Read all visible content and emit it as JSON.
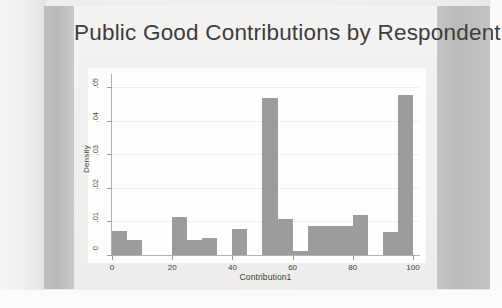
{
  "slide": {
    "title": "Public Good Contributions by Respondent",
    "background_color": "#f1f0ee",
    "band_color": "#bcbcbc"
  },
  "chart_data": {
    "type": "bar",
    "title": "Public Good Contributions by Respondent",
    "xlabel": "Contribution1",
    "ylabel": "Density",
    "xlim": [
      0,
      102
    ],
    "ylim": [
      0,
      0.054
    ],
    "xticks": [
      0,
      20,
      40,
      60,
      80,
      100
    ],
    "xtick_labels": [
      "0",
      "20",
      "40",
      "60",
      "80",
      "100"
    ],
    "yticks": [
      0,
      0.01,
      0.02,
      0.03,
      0.04,
      0.05
    ],
    "ytick_labels": [
      "0",
      ".01",
      ".02",
      ".03",
      ".04",
      ".05"
    ],
    "grid": true,
    "grid_axis": "y",
    "legend": "none",
    "bar_color": "#9c9c9c",
    "plot_background": "#fefefe",
    "bin_width": 5,
    "bins_start": [
      0,
      5,
      20,
      25,
      30,
      40,
      50,
      55,
      60,
      65,
      70,
      75,
      80,
      90,
      95
    ],
    "values": [
      0.0072,
      0.0044,
      0.0113,
      0.0044,
      0.005,
      0.0078,
      0.0467,
      0.0106,
      0.0011,
      0.0086,
      0.0086,
      0.0086,
      0.0119,
      0.007,
      0.0478
    ],
    "categories": [
      "0-5",
      "5-10",
      "20-25",
      "25-30",
      "30-35",
      "40-45",
      "50-55",
      "55-60",
      "60-65",
      "65-70",
      "70-75",
      "75-80",
      "80-85",
      "90-95",
      "95-100"
    ]
  }
}
